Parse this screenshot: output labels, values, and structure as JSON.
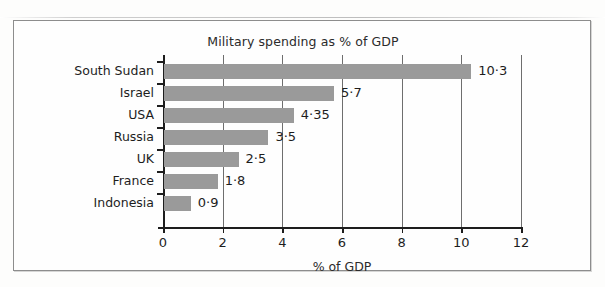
{
  "figure": {
    "frame_visible": true,
    "background_color": "#fdfdfc"
  },
  "chart_data": {
    "type": "bar",
    "orientation": "horizontal",
    "title": "Military spending as % of GDP",
    "xlabel": "% of GDP",
    "ylabel": "",
    "xlim": [
      0,
      12
    ],
    "xticks": [
      "0",
      "2",
      "4",
      "6",
      "8",
      "10",
      "12"
    ],
    "xtick_values": [
      0,
      2,
      4,
      6,
      8,
      10,
      12
    ],
    "grid": "vertical",
    "legend": "none",
    "bar_color": "#9a9a9a",
    "categories": [
      "South Sudan",
      "Israel",
      "USA",
      "Russia",
      "UK",
      "France",
      "Indonesia"
    ],
    "values": [
      10.3,
      5.7,
      4.35,
      3.5,
      2.5,
      1.8,
      0.9
    ],
    "value_labels": [
      "10·3",
      "5·7",
      "4·35",
      "3·5",
      "2·5",
      "1·8",
      "0·9"
    ],
    "bars": [
      {
        "category": "South Sudan",
        "value": 10.3,
        "label": "10·3"
      },
      {
        "category": "Israel",
        "value": 5.7,
        "label": "5·7"
      },
      {
        "category": "USA",
        "value": 4.35,
        "label": "4·35"
      },
      {
        "category": "Russia",
        "value": 3.5,
        "label": "3·5"
      },
      {
        "category": "UK",
        "value": 2.5,
        "label": "2·5"
      },
      {
        "category": "France",
        "value": 1.8,
        "label": "1·8"
      },
      {
        "category": "Indonesia",
        "value": 0.9,
        "label": "0·9"
      }
    ]
  }
}
